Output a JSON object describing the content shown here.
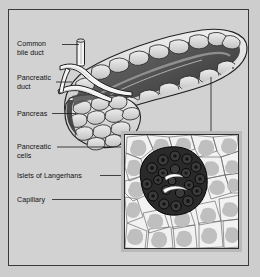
{
  "figure": {
    "background_color": "#cdcdcd",
    "plate_color": "#d2d2d2",
    "border_color": "#3a3a3a"
  },
  "labels": {
    "common_bile_duct": "Common\nbile duct",
    "pancreatic_duct": "Pancreatic\nduct",
    "pancreas": "Pancreas",
    "pancreatic_cells": "Pancreatic\ncells",
    "islets_of_langerhans": "Islets of Langerhans",
    "capillary": "Capillary"
  },
  "organ": {
    "name": "pancreas-illustration",
    "regions": [
      "head",
      "body",
      "tail"
    ],
    "duct_color": "#f2f2f2",
    "lobule_fill": "#d8d8d8",
    "lobule_stroke": "#2b2b2b",
    "shadow_fill": "#4a4a4a"
  },
  "inset": {
    "name": "histology-inset",
    "frame_color": "#b9b9b9",
    "border_color": "#2e2e2e",
    "background": "#ececec",
    "acinar_cell_fill": "#bcbcbc",
    "acinar_outline": "#6d6d6d",
    "islet_fill": "#2a2a2a",
    "islet_cell_outline": "#000000",
    "capillary_color": "#ffffff"
  },
  "leaders": {
    "color": "#1a1a1a",
    "count": 7
  }
}
